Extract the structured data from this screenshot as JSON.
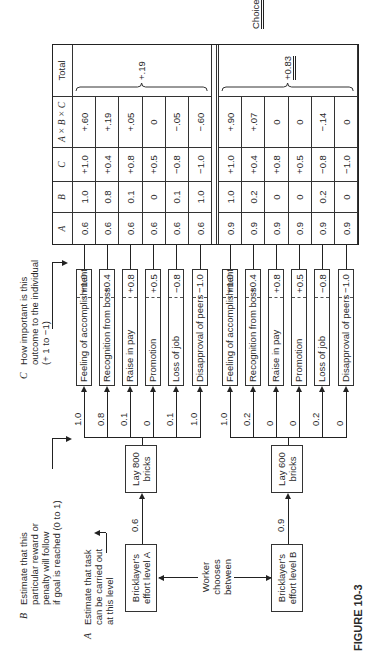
{
  "figure_label": "FIGURE 10-3",
  "legend": {
    "A": {
      "letter": "A",
      "lines": [
        "Estimate that task",
        "can be carried out",
        "at this level"
      ]
    },
    "B": {
      "letter": "B",
      "lines": [
        "Estimate that this",
        "particular reward or",
        "penalty will follow",
        "if goal is reached (0 to 1)"
      ]
    },
    "C": {
      "letter": "C",
      "lines": [
        "How important is this",
        "outcome to the individual",
        "(+ 1 to −1)"
      ]
    }
  },
  "worker_choice": {
    "lines": [
      "Worker",
      "chooses",
      "between"
    ]
  },
  "levels": [
    {
      "effort_label": [
        "Bricklayer's",
        "effort level A"
      ],
      "task_label": [
        "Lay 800",
        "bricks"
      ],
      "a_estimate": "0.6",
      "outcomes": [
        {
          "label": "Feeling of accomplishment",
          "c": "+1.0",
          "b": "1.0"
        },
        {
          "label": "Recognition from boss",
          "c": "+0.4",
          "b": "0.8"
        },
        {
          "label": "Raise in pay",
          "c": "+0.8",
          "b": "0.1"
        },
        {
          "label": "Promotion",
          "c": "+0.5",
          "b": "0"
        },
        {
          "label": "Loss of job",
          "c": "−0.8",
          "b": "0.1"
        },
        {
          "label": "Disapproval of peers",
          "c": "−1.0",
          "b": "1.0"
        }
      ],
      "rows": [
        {
          "A": "0.6",
          "B": "1.0",
          "C": "+1.0",
          "ABC": "+.60"
        },
        {
          "A": "0.6",
          "B": "0.8",
          "C": "+0.4",
          "ABC": "+.19"
        },
        {
          "A": "0.6",
          "B": "0.1",
          "C": "+0.8",
          "ABC": "+.05"
        },
        {
          "A": "0.6",
          "B": "0",
          "C": "+0.5",
          "ABC": "0"
        },
        {
          "A": "0.6",
          "B": "0.1",
          "C": "−0.8",
          "ABC": "−.05"
        },
        {
          "A": "0.6",
          "B": "1.0",
          "C": "−1.0",
          "ABC": "−.60"
        }
      ],
      "total": "+.19"
    },
    {
      "effort_label": [
        "Bricklayer's",
        "effort level B"
      ],
      "task_label": [
        "Lay 600",
        "bricks"
      ],
      "a_estimate": "0.9",
      "outcomes": [
        {
          "label": "Feeling of accomplishment",
          "c": "+1.0",
          "b": "1.0"
        },
        {
          "label": "Recognition from boss",
          "c": "+0.4",
          "b": "0.2"
        },
        {
          "label": "Raise in pay",
          "c": "+0.8",
          "b": "0"
        },
        {
          "label": "Promotion",
          "c": "+0.5",
          "b": "0"
        },
        {
          "label": "Loss of job",
          "c": "−0.8",
          "b": "0.2"
        },
        {
          "label": "Disapproval of peers",
          "c": "−1.0",
          "b": "0"
        }
      ],
      "rows": [
        {
          "A": "0.9",
          "B": "1.0",
          "C": "+1.0",
          "ABC": "+.90"
        },
        {
          "A": "0.9",
          "B": "0.2",
          "C": "+0.4",
          "ABC": "+.07"
        },
        {
          "A": "0.9",
          "B": "0",
          "C": "+0.8",
          "ABC": "0"
        },
        {
          "A": "0.9",
          "B": "0",
          "C": "+0.5",
          "ABC": "0"
        },
        {
          "A": "0.9",
          "B": "0.2",
          "C": "−0.8",
          "ABC": "−.14"
        },
        {
          "A": "0.9",
          "B": "0",
          "C": "−1.0",
          "ABC": "0"
        }
      ],
      "total": "+0.83"
    }
  ],
  "table_headers": {
    "A": "A",
    "B": "B",
    "C": "C",
    "ABC": "A × B × C",
    "total": "Total"
  },
  "choice_label": "Choice"
}
